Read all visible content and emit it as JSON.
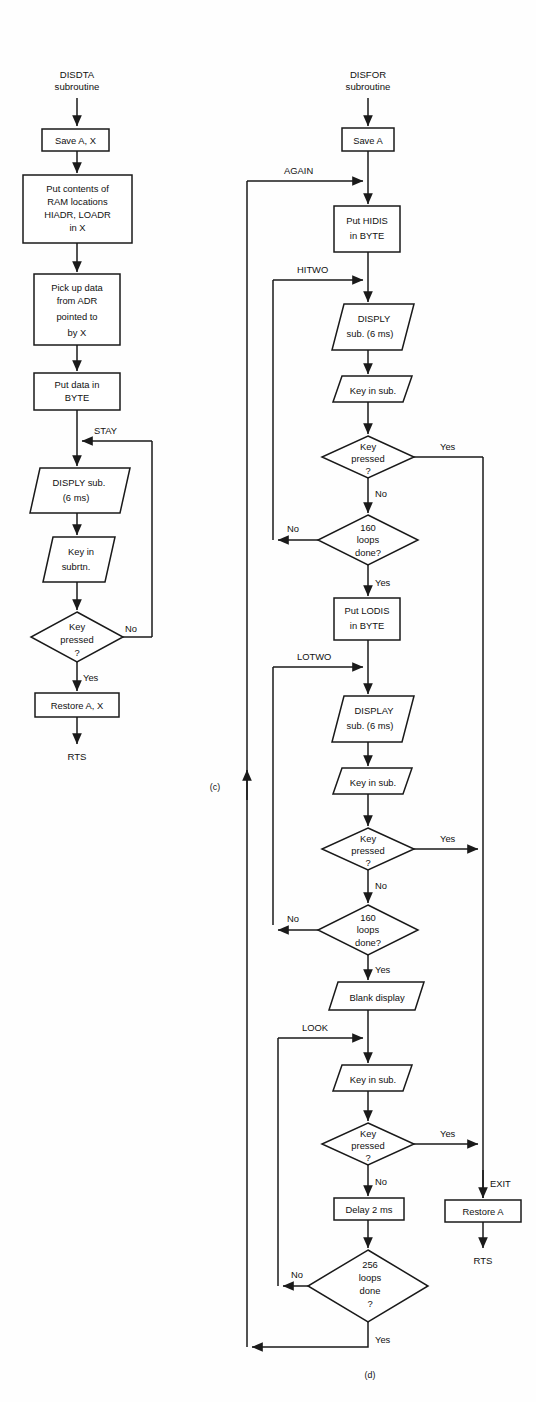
{
  "figure": {
    "left_caption": "(c)",
    "right_caption": "(d)"
  },
  "left_chart": {
    "entry": "DISDTA",
    "entry_sub": "subroutine",
    "exit": "RTS",
    "nodes": [
      {
        "id": "save",
        "kind": "process",
        "lines": [
          "Save A, X"
        ]
      },
      {
        "id": "putram",
        "kind": "process",
        "lines": [
          "Put contents of",
          "RAM locations",
          "HIADR, LOADR",
          "in X"
        ]
      },
      {
        "id": "pickup",
        "kind": "process",
        "lines": [
          "Pick up data",
          "from ADR",
          "pointed to",
          "by X"
        ]
      },
      {
        "id": "putdata",
        "kind": "process",
        "lines": [
          "Put data in",
          "BYTE"
        ]
      },
      {
        "id": "disply",
        "kind": "subproc",
        "lines": [
          "DISPLY sub.",
          "(6 ms)"
        ]
      },
      {
        "id": "keyin",
        "kind": "subproc",
        "lines": [
          "Key in",
          "subrtn."
        ]
      },
      {
        "id": "keypr",
        "kind": "decision",
        "lines": [
          "Key",
          "pressed",
          "?"
        ]
      },
      {
        "id": "restore",
        "kind": "process",
        "lines": [
          "Restore A, X"
        ]
      }
    ],
    "labels": {
      "stay": "STAY",
      "no": "No",
      "yes": "Yes"
    }
  },
  "right_chart": {
    "entry": "DISFOR",
    "entry_sub": "subroutine",
    "exit": "RTS",
    "nodes": [
      {
        "id": "saveA",
        "kind": "process",
        "lines": [
          "Save A"
        ]
      },
      {
        "id": "puthidis",
        "kind": "process",
        "lines": [
          "Put HIDIS",
          "in BYTE"
        ]
      },
      {
        "id": "disp1",
        "kind": "subproc",
        "lines": [
          "DISPLY",
          "sub. (6 ms)"
        ]
      },
      {
        "id": "key1",
        "kind": "subproc",
        "lines": [
          "Key in sub."
        ]
      },
      {
        "id": "keypr1",
        "kind": "decision",
        "lines": [
          "Key",
          "pressed",
          "?"
        ]
      },
      {
        "id": "loop1",
        "kind": "decision",
        "lines": [
          "160",
          "loops",
          "done?"
        ]
      },
      {
        "id": "putlodis",
        "kind": "process",
        "lines": [
          "Put LODIS",
          "in BYTE"
        ]
      },
      {
        "id": "disp2",
        "kind": "subproc",
        "lines": [
          "DISPLAY",
          "sub. (6 ms)"
        ]
      },
      {
        "id": "key2",
        "kind": "subproc",
        "lines": [
          "Key in sub."
        ]
      },
      {
        "id": "keypr2",
        "kind": "decision",
        "lines": [
          "Key",
          "pressed",
          "?"
        ]
      },
      {
        "id": "loop2",
        "kind": "decision",
        "lines": [
          "160",
          "loops",
          "done?"
        ]
      },
      {
        "id": "blank",
        "kind": "subproc",
        "lines": [
          "Blank display"
        ]
      },
      {
        "id": "key3",
        "kind": "subproc",
        "lines": [
          "Key in sub."
        ]
      },
      {
        "id": "keypr3",
        "kind": "decision",
        "lines": [
          "Key",
          "pressed",
          "?"
        ]
      },
      {
        "id": "delay",
        "kind": "process",
        "lines": [
          "Delay 2 ms"
        ]
      },
      {
        "id": "loop3",
        "kind": "decision",
        "lines": [
          "256",
          "loops",
          "done",
          "?"
        ]
      },
      {
        "id": "restoreA",
        "kind": "process",
        "lines": [
          "Restore A"
        ]
      }
    ],
    "labels": {
      "again": "AGAIN",
      "hitwo": "HITWO",
      "lotwo": "LOTWO",
      "look": "LOOK",
      "exit": "EXIT",
      "yes": "Yes",
      "no": "No"
    }
  }
}
